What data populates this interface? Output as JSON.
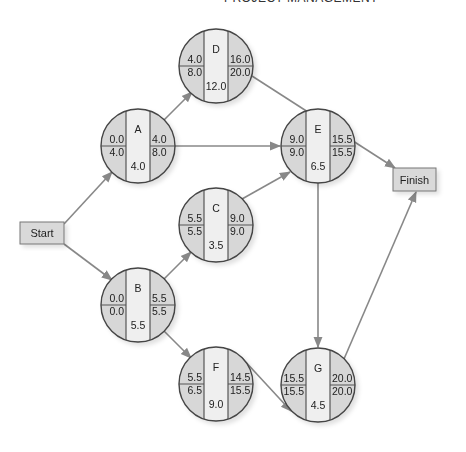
{
  "header": {
    "title": "PROJECT MANAGEMENT"
  },
  "colors": {
    "node_fill": "#d7d7d7",
    "center_fill": "#efefef",
    "stroke": "#444444",
    "arrow": "#888888",
    "box_fill": "#d9d9d9"
  },
  "terminals": {
    "start": {
      "label": "Start"
    },
    "finish": {
      "label": "Finish"
    }
  },
  "nodes": [
    {
      "id": "A",
      "duration": "4.0",
      "es": "0.0",
      "ef": "4.0",
      "ls": "4.0",
      "lf": "8.0"
    },
    {
      "id": "B",
      "duration": "5.5",
      "es": "0.0",
      "ef": "5.5",
      "ls": "0.0",
      "lf": "5.5"
    },
    {
      "id": "C",
      "duration": "3.5",
      "es": "5.5",
      "ef": "9.0",
      "ls": "5.5",
      "lf": "9.0"
    },
    {
      "id": "D",
      "duration": "12.0",
      "es": "4.0",
      "ef": "16.0",
      "ls": "8.0",
      "lf": "20.0"
    },
    {
      "id": "E",
      "duration": "6.5",
      "es": "9.0",
      "ef": "15.5",
      "ls": "9.0",
      "lf": "15.5"
    },
    {
      "id": "F",
      "duration": "9.0",
      "es": "5.5",
      "ef": "14.5",
      "ls": "6.5",
      "lf": "15.5"
    },
    {
      "id": "G",
      "duration": "4.5",
      "es": "15.5",
      "ef": "20.0",
      "ls": "15.5",
      "lf": "20.0"
    }
  ],
  "edges": [
    [
      "Start",
      "A"
    ],
    [
      "Start",
      "B"
    ],
    [
      "A",
      "D"
    ],
    [
      "A",
      "E"
    ],
    [
      "B",
      "C"
    ],
    [
      "B",
      "F"
    ],
    [
      "C",
      "E"
    ],
    [
      "E",
      "G"
    ],
    [
      "F",
      "G"
    ],
    [
      "D",
      "Finish"
    ],
    [
      "G",
      "Finish"
    ]
  ]
}
